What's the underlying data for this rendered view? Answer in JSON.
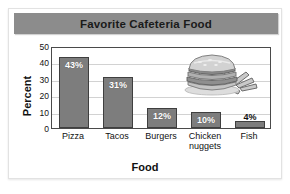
{
  "card": {
    "decoration_icon": "hamburger-and-fries-image"
  },
  "chart_data": {
    "type": "bar",
    "title": "Favorite Cafeteria Food",
    "xlabel": "Food",
    "ylabel": "Percent",
    "categories": [
      "Pizza",
      "Tacos",
      "Burgers",
      "Chicken nuggets",
      "Fish"
    ],
    "values": [
      43,
      31,
      12,
      10,
      4
    ],
    "value_labels": [
      "43%",
      "31%",
      "12%",
      "10%",
      "4%"
    ],
    "ylim": [
      0,
      50
    ],
    "yticks": [
      50,
      40,
      30,
      20,
      10,
      0
    ],
    "ytick_labels": [
      "50",
      "40",
      "30",
      "20",
      "10",
      "0"
    ],
    "grid": true,
    "legend": "none",
    "colors": {
      "bar_fill": "#7d7d7d",
      "bar_stroke": "#3f3f3f",
      "title_band": "#8c8c8c",
      "plot_border": "#4a4a4a",
      "gridline": "#d2d2d2",
      "text": "#111111",
      "value_label_inside": "#ffffff"
    }
  }
}
